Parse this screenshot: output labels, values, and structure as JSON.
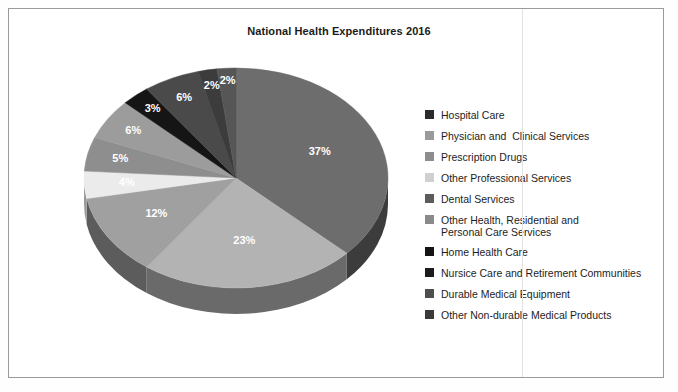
{
  "chart_data": {
    "type": "pie",
    "title": "National Health Expenditures 2016",
    "xlabel": "",
    "ylabel": "",
    "legend_position": "right",
    "grid": false,
    "three_d": true,
    "start_angle_deg": 0,
    "direction": "clockwise",
    "categories": [
      "Hospital Care",
      "Physician and  Clinical Services",
      "Prescription Drugs",
      "Other Professional Services",
      "Dental Services",
      "Other Health, Residential and\nPersonal Care Services",
      "Home Health Care",
      "Nursice Care and Retirement Communities",
      "Durable Medical Equipment",
      "Other Non-durable Medical Products"
    ],
    "values": [
      37,
      23,
      12,
      4,
      5,
      6,
      3,
      6,
      2,
      2
    ],
    "data_labels": [
      "37%",
      "23%",
      "12%",
      "4%",
      "5%",
      "6%",
      "3%",
      "6%",
      "2%",
      "2%"
    ],
    "colors": [
      "#6d6d6d",
      "#b3b3b3",
      "#a0a0a0",
      "#ebebeb",
      "#8e8e8e",
      "#9c9c9c",
      "#151515",
      "#4a4a4a",
      "#3c3c3c",
      "#565656"
    ],
    "side_colors": [
      "#3c3c3c",
      "#6a6a6a",
      "#5c5c5c",
      "#9a9a9a",
      "#525252",
      "#5a5a5a",
      "#0a0a0a",
      "#262626",
      "#1e1e1e",
      "#2e2e2e"
    ]
  },
  "legend": {
    "items": [
      {
        "label": "Hospital Care",
        "color": "#2b2b2b"
      },
      {
        "label": "Physician and  Clinical Services",
        "color": "#9a9a9a"
      },
      {
        "label": "Prescription Drugs",
        "color": "#8d8d8d"
      },
      {
        "label": "Other Professional Services",
        "color": "#d0d0d0"
      },
      {
        "label": "Dental Services",
        "color": "#5c5c5c"
      },
      {
        "label": "Other Health, Residential and\nPersonal Care Services",
        "color": "#8a8a8a"
      },
      {
        "label": "Home Health Care",
        "color": "#141414"
      },
      {
        "label": "Nursice Care and Retirement Communities",
        "color": "#1c1c1c"
      },
      {
        "label": "Durable Medical Equipment",
        "color": "#4e4e4e"
      },
      {
        "label": "Other Non-durable Medical Products",
        "color": "#3a3a3a"
      }
    ]
  }
}
